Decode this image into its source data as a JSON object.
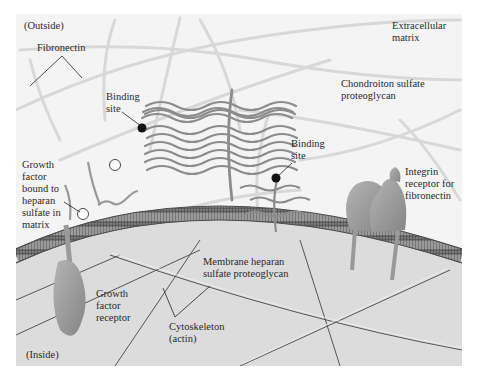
{
  "figure": {
    "regions": {
      "outside": "(Outside)",
      "inside": "(Inside)"
    },
    "labels": {
      "fibronectin": "Fibronectin",
      "extracellular_matrix": "Extracellular\nmatrix",
      "binding_site_1": "Binding\nsite",
      "chondroitin": "Chondroiton sulfate\nproteoglycan",
      "binding_site_2": "Binding\nsite",
      "growth_factor_bound": "Growth\nfactor\nbound to\nheparan\nsulfate in\nmatrix",
      "integrin": "Integrin\nreceptor for\nfibronectin",
      "membrane_heparan": "Membrane heparan\nsulfate proteoglycan",
      "growth_factor_receptor": "Growth\nfactor\nreceptor",
      "cytoskeleton": "Cytoskeleton\n(actin)"
    },
    "colors": {
      "background_outside": "#f4f4f4",
      "cytoplasm": "#dcdcdc",
      "membrane": "#7a7a7a",
      "strand": "#8a8a8a",
      "fiber": "#d6d6d6",
      "protein": "#9a9a9a",
      "text": "#2a2a2a"
    }
  }
}
